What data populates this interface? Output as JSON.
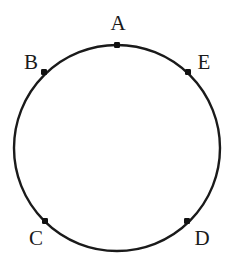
{
  "figure": {
    "title": "",
    "background_color": "#ffffff",
    "stroke_color": "#1a1a1a",
    "point_color": "#111111",
    "circle": {
      "center_x": 117,
      "center_y": 148,
      "radius": 103,
      "stroke_width": 2.4
    },
    "points": [
      {
        "id": "A",
        "label": "A",
        "x": 117,
        "y": 45,
        "label_x": 118,
        "label_y": 23,
        "marker_size": 6
      },
      {
        "id": "B",
        "label": "B",
        "x": 44,
        "y": 72,
        "label_x": 31,
        "label_y": 62,
        "marker_size": 6
      },
      {
        "id": "C",
        "label": "C",
        "x": 45,
        "y": 221,
        "label_x": 36,
        "label_y": 238,
        "marker_size": 6
      },
      {
        "id": "D",
        "label": "D",
        "x": 187,
        "y": 221,
        "label_x": 202,
        "label_y": 238,
        "marker_size": 6
      },
      {
        "id": "E",
        "label": "E",
        "x": 188,
        "y": 72,
        "label_x": 204,
        "label_y": 62,
        "marker_size": 6
      }
    ]
  }
}
